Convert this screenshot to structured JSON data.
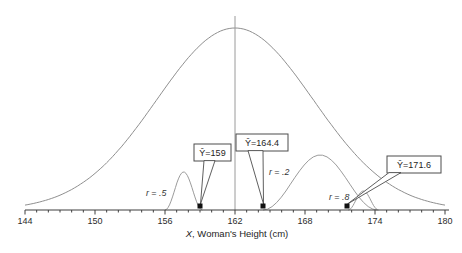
{
  "figure": {
    "background": "#ffffff",
    "curve_color": "#9b9b9b",
    "population_curve_color": "#8f8f8f",
    "mean_line_color": "#9a9a9a",
    "axis_color": "#3f3f3f",
    "text_color": "#222222",
    "marker_color": "#111111",
    "callout_border_color": "#4d4d4d",
    "callout_fill": "#ffffff"
  },
  "chart_data": {
    "type": "line",
    "title": "",
    "xlabel_var": "X",
    "xlabel_rest": ", Woman's Height (cm)",
    "x_axis": {
      "min": 144,
      "max": 180,
      "major_step": 6,
      "minor_step": 1,
      "tick_labels": [
        "144",
        "150",
        "156",
        "162",
        "168",
        "174",
        "180"
      ],
      "grid": "off"
    },
    "y_axis": {
      "shown": false
    },
    "population_curve": {
      "shape": "normal",
      "mean": 162,
      "sd": 6.7,
      "peak_px_height": 182
    },
    "mean_line_x": 162,
    "conditional_distributions": [
      {
        "r": 0.5,
        "r_label": "r = .5",
        "yhat": 159,
        "callout_label": "Ŷ=159",
        "span_start": 156,
        "span_end": 159.2,
        "peak_px_height": 38
      },
      {
        "r": 0.2,
        "r_label": "r = .2",
        "yhat": 164.4,
        "callout_label": "Ŷ=164.4",
        "span_start": 164.4,
        "span_end": 174.2,
        "peak_px_height": 55
      },
      {
        "r": 0.8,
        "r_label": "r = .8",
        "yhat": 171.6,
        "callout_label": "Ŷ=171.6",
        "span_start": 171.7,
        "span_end": 174.3,
        "peak_px_height": 19
      }
    ]
  }
}
